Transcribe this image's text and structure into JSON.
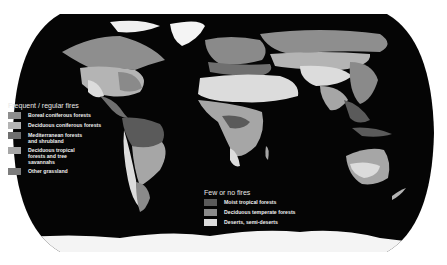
{
  "map": {
    "title": "Global fire regimes by vegetation type",
    "projection": "Robinson (oval)",
    "colors": {
      "background": "#ffffff",
      "ocean": "#050505",
      "boreal_coniferous": "#8e8e8e",
      "deciduous_coniferous": "#b4b4b4",
      "mediterranean": "#6f6f6f",
      "deciduous_tropical": "#a6a6a6",
      "other_grassland": "#7c7c7c",
      "moist_tropical": "#5a5a5a",
      "deciduous_temperate": "#8a8a8a",
      "deserts": "#dcdcdc",
      "ice": "#f6f6f6"
    }
  },
  "legend_frequent": {
    "title": "Frequent / regular fires",
    "items": [
      {
        "label": "Boreal coniferous forests",
        "color": "#8e8e8e"
      },
      {
        "label": "Deciduous coniferous forests",
        "color": "#b4b4b4"
      },
      {
        "label": "Mediterranean forests\nand shrubland",
        "color": "#6f6f6f"
      },
      {
        "label": "Deciduous tropical\nforests and tree\nsavannahs",
        "color": "#a6a6a6"
      },
      {
        "label": "Other grassland",
        "color": "#7c7c7c"
      }
    ]
  },
  "legend_few": {
    "title": "Few or no fires",
    "items": [
      {
        "label": "Moist tropical forests",
        "color": "#5a5a5a"
      },
      {
        "label": "Deciduous temperate forests",
        "color": "#8a8a8a"
      },
      {
        "label": "Deserts, semi-deserts",
        "color": "#dcdcdc"
      }
    ]
  }
}
